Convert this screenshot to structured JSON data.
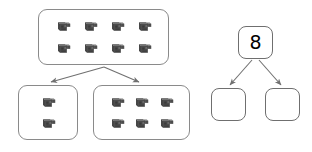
{
  "canvas": {
    "width": 312,
    "height": 152,
    "background": "#ffffff"
  },
  "palette": {
    "box_border": "#8a8a8a",
    "bond_border": "#6f6f6f",
    "arrow": "#707070",
    "cube_front": "#4d4d4d",
    "cube_top": "#7a7a7a",
    "cube_side": "#3a3a3a",
    "digit": "#000000"
  },
  "worksheet": {
    "title": "number-bond-decomposition",
    "cube_model": {
      "left_panel": {
        "whole_group": {
          "label": "top-group-box",
          "count": 8,
          "rows": 2,
          "cols": 4,
          "x": 38,
          "y": 9,
          "width": 131,
          "height": 56
        },
        "part_groups": [
          {
            "label": "bottom-left-group-box",
            "count": 2,
            "rows": 2,
            "cols": 1,
            "x": 18,
            "y": 85,
            "width": 60,
            "height": 55
          },
          {
            "label": "bottom-right-group-box",
            "count": 6,
            "rows": 2,
            "cols": 3,
            "x": 93,
            "y": 85,
            "width": 97,
            "height": 55
          }
        ],
        "arrows": [
          {
            "name": "arrow-to-left-part",
            "x1": 104,
            "y1": 67,
            "x2": 50,
            "y2": 82
          },
          {
            "name": "arrow-to-right-part",
            "x1": 104,
            "y1": 67,
            "x2": 140,
            "y2": 82
          }
        ]
      },
      "right_panel": {
        "whole_box": {
          "label": "bond-whole-box",
          "value": "8",
          "x": 238,
          "y": 26,
          "width": 35,
          "height": 33
        },
        "part_boxes": [
          {
            "label": "bond-part-left-box",
            "value": "",
            "x": 211,
            "y": 88,
            "width": 35,
            "height": 33
          },
          {
            "label": "bond-part-right-box",
            "value": "",
            "x": 265,
            "y": 88,
            "width": 35,
            "height": 33
          }
        ],
        "arrows": [
          {
            "name": "bond-arrow-left",
            "x1": 253,
            "y1": 60,
            "x2": 229,
            "y2": 85
          },
          {
            "name": "bond-arrow-right",
            "x1": 258,
            "y1": 60,
            "x2": 282,
            "y2": 85
          }
        ]
      }
    },
    "icons": {
      "cube": "cube-icon",
      "arrow": "arrow-icon"
    }
  }
}
